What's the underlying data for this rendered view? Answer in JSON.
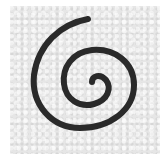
{
  "image": {
    "subject": "hand-drawn spiral",
    "stroke_color": "#2a2a2a",
    "background_color": "#e6e6e6",
    "border_color": "#ffffff"
  }
}
